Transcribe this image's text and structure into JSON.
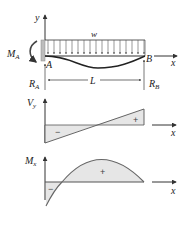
{
  "beam": {
    "y_axis_label": "y",
    "x_axis_label": "x",
    "load_label": "w",
    "moment_label": "M",
    "moment_sub": "A",
    "point_a": "A",
    "point_b": "B",
    "reaction_a": "R",
    "reaction_a_sub": "A",
    "reaction_b": "R",
    "reaction_b_sub": "B",
    "length_label": "L"
  },
  "shear": {
    "y_axis_label": "V",
    "y_axis_sub": "y",
    "x_axis_label": "x",
    "neg_sign": "−",
    "pos_sign": "+"
  },
  "moment": {
    "y_axis_label": "M",
    "y_axis_sub": "x",
    "x_axis_label": "x",
    "neg_sign": "−",
    "pos_sign": "+"
  },
  "colors": {
    "line": "#333333",
    "fill": "#e6e6e6",
    "wall": "#bdbdbd"
  }
}
